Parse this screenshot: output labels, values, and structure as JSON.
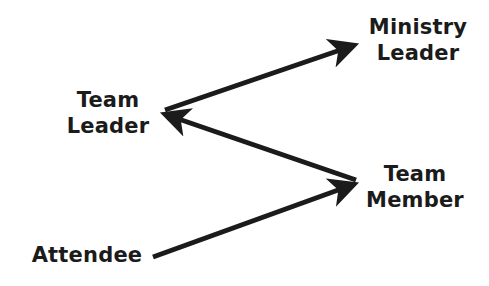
{
  "diagram": {
    "nodes": [
      {
        "id": "ministry_leader",
        "lines": [
          "Ministry",
          "Leader"
        ]
      },
      {
        "id": "team_leader",
        "lines": [
          "Team",
          "Leader"
        ]
      },
      {
        "id": "team_member",
        "lines": [
          "Team",
          "Member"
        ]
      },
      {
        "id": "attendee",
        "lines": [
          "Attendee"
        ]
      }
    ],
    "edges": [
      {
        "from": "attendee",
        "to": "team_member"
      },
      {
        "from": "team_member",
        "to": "team_leader"
      },
      {
        "from": "team_leader",
        "to": "ministry_leader"
      }
    ],
    "colors": {
      "text": "#1b1b1b",
      "arrow": "#1b1b1b",
      "background": "#ffffff"
    }
  }
}
